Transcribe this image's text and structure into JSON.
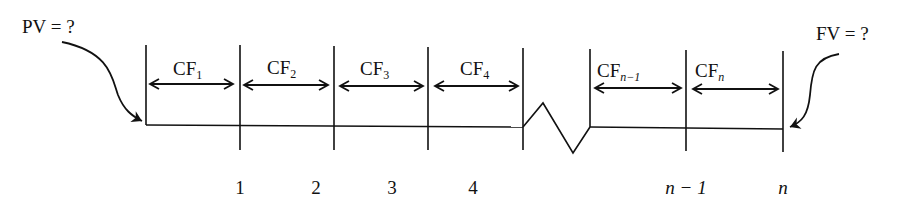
{
  "diagram": {
    "type": "cash-flow-timeline",
    "present_value_label": "PV = ?",
    "future_value_label": "FV = ?",
    "cash_flows": [
      {
        "base": "CF",
        "sub": "1"
      },
      {
        "base": "CF",
        "sub": "2"
      },
      {
        "base": "CF",
        "sub": "3"
      },
      {
        "base": "CF",
        "sub": "4"
      },
      {
        "base": "CF",
        "sub": "n−1"
      },
      {
        "base": "CF",
        "sub": "n"
      }
    ],
    "period_labels": [
      "1",
      "2",
      "3",
      "4",
      "n − 1",
      "n"
    ],
    "break_symbol": "zigzag",
    "colors": {
      "ink": "#111111",
      "background": "#ffffff"
    }
  }
}
